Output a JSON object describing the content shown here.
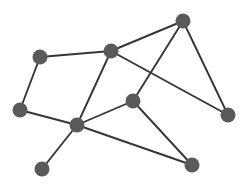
{
  "figure": {
    "width": 246,
    "height": 187,
    "background_color": "#ffffff"
  },
  "style": {
    "node_fill": "#5a5a5a",
    "node_radius": 7.5,
    "edge_color": "#363636",
    "edge_width": 1.9
  },
  "chart_data": {
    "type": "graph",
    "title": "",
    "layout": "spring",
    "directed": false,
    "node_count": 9,
    "edge_count": 12,
    "nodes": [
      {
        "id": "n0",
        "label": "",
        "x": 40,
        "y": 57,
        "degree": 2
      },
      {
        "id": "n1",
        "label": "",
        "x": 111,
        "y": 51,
        "degree": 4
      },
      {
        "id": "n2",
        "label": "",
        "x": 183,
        "y": 21,
        "degree": 3
      },
      {
        "id": "n3",
        "label": "",
        "x": 20,
        "y": 110,
        "degree": 2
      },
      {
        "id": "n4",
        "label": "",
        "x": 77,
        "y": 125,
        "degree": 5
      },
      {
        "id": "n5",
        "label": "",
        "x": 133,
        "y": 101,
        "degree": 3
      },
      {
        "id": "n6",
        "label": "",
        "x": 228,
        "y": 115,
        "degree": 2
      },
      {
        "id": "n7",
        "label": "",
        "x": 42,
        "y": 169,
        "degree": 1
      },
      {
        "id": "n8",
        "label": "",
        "x": 192,
        "y": 165,
        "degree": 2
      }
    ],
    "edges": [
      {
        "source": "n0",
        "target": "n1"
      },
      {
        "source": "n0",
        "target": "n3"
      },
      {
        "source": "n3",
        "target": "n4"
      },
      {
        "source": "n4",
        "target": "n1"
      },
      {
        "source": "n1",
        "target": "n2"
      },
      {
        "source": "n1",
        "target": "n6"
      },
      {
        "source": "n2",
        "target": "n5"
      },
      {
        "source": "n2",
        "target": "n6"
      },
      {
        "source": "n4",
        "target": "n5"
      },
      {
        "source": "n4",
        "target": "n7"
      },
      {
        "source": "n4",
        "target": "n8"
      },
      {
        "source": "n5",
        "target": "n8"
      }
    ]
  }
}
